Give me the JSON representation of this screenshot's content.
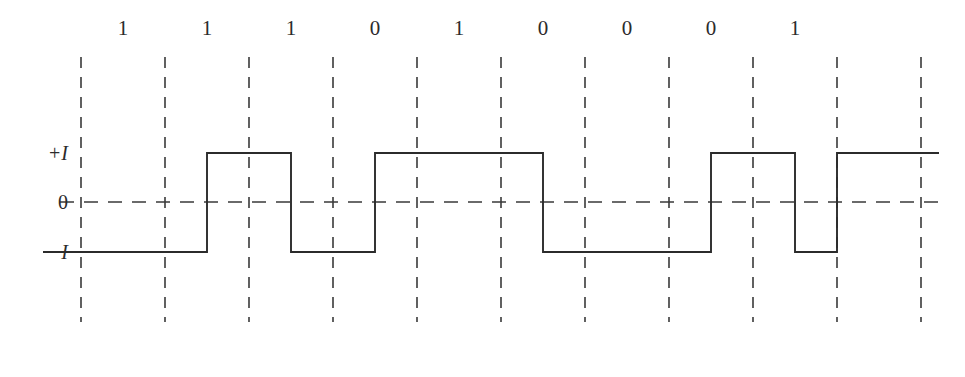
{
  "figure": {
    "type": "signal-waveform-diagram",
    "width": 965,
    "height": 377,
    "background_color": "#ffffff",
    "line_color": "#2b2b2b",
    "grid_color": "#3a3a3a"
  },
  "axis_labels": {
    "positive": "+I",
    "zero": "0",
    "negative": "−I"
  },
  "bits": [
    "1",
    "1",
    "1",
    "0",
    "1",
    "0",
    "0",
    "0",
    "1"
  ],
  "chart_data": {
    "type": "line",
    "title": "",
    "xlabel": "",
    "ylabel": "",
    "categories": [
      "1",
      "1",
      "1",
      "0",
      "1",
      "0",
      "0",
      "0",
      "1"
    ],
    "levels": [
      "-I",
      "+I",
      "-I",
      "+I",
      "+I",
      "-I",
      "-I",
      "+I",
      "-I"
    ],
    "values": [
      -1,
      1,
      -1,
      1,
      1,
      -1,
      -1,
      1,
      -1
    ],
    "tail_level": "+I",
    "tail_value": 1,
    "ylim": [
      -1,
      1
    ],
    "ytick_labels": [
      "+I",
      "0",
      "−I"
    ],
    "ytick_values": [
      1,
      0,
      -1
    ],
    "grid": true,
    "grid_lines": 11,
    "legend": "none",
    "waveform_style": "square",
    "transition_position": "bit-boundary"
  },
  "geometry": {
    "plot_left": 81,
    "plot_right": 921,
    "grid_spacing": 84,
    "grid_count": 11,
    "grid_top": 57,
    "grid_bottom": 322,
    "y_high": 153,
    "y_zero": 202,
    "y_low": 252,
    "bit_label_y": 18,
    "first_bit_center_x": 123,
    "bit_pitch": 84
  }
}
